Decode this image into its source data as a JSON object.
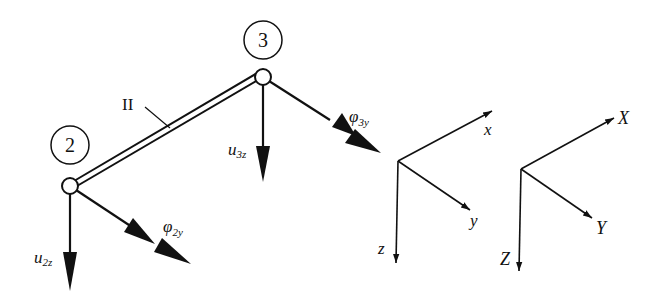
{
  "diagram": {
    "nodes": [
      {
        "id": "2",
        "label": "2",
        "x": 70,
        "y": 186,
        "label_x": 70,
        "label_y": 145
      },
      {
        "id": "3",
        "label": "3",
        "x": 263,
        "y": 77,
        "label_x": 263,
        "label_y": 40
      }
    ],
    "member": {
      "label": "II",
      "from": "2",
      "to": "3"
    },
    "dof_labels": {
      "u2z": {
        "base": "u",
        "sub": "2z"
      },
      "phi2y": {
        "base": "φ",
        "sub": "2y"
      },
      "u3z": {
        "base": "u",
        "sub": "3z"
      },
      "phi3y": {
        "base": "φ",
        "sub": "3y"
      }
    },
    "local_axes": {
      "x": "x",
      "y": "y",
      "z": "z"
    },
    "global_axes": {
      "X": "X",
      "Y": "Y",
      "Z": "Z"
    },
    "colors": {
      "ink": "#111111",
      "background": "#ffffff"
    }
  }
}
